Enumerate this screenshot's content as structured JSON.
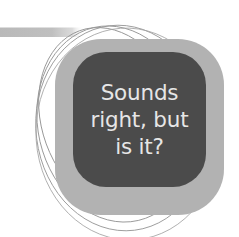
{
  "image": {
    "width": 239,
    "height": 237,
    "background_color": "#ffffff"
  },
  "callout": {
    "name": "rounded-square-callout",
    "frame_color": "#b2b2b2",
    "inner_color": "#4b4b4b",
    "text_color": "#e6e6e6",
    "lines": [
      "Sounds",
      "right, but",
      "is it?"
    ],
    "full_text": "Sounds right, but is it?"
  },
  "decorations": {
    "top_band": {
      "name": "horizontal-gray-band",
      "color": "#bcbcbc"
    },
    "arcs": {
      "name": "thin-ellipse-arcs",
      "color": "#9a9a9a",
      "count": 4
    }
  }
}
